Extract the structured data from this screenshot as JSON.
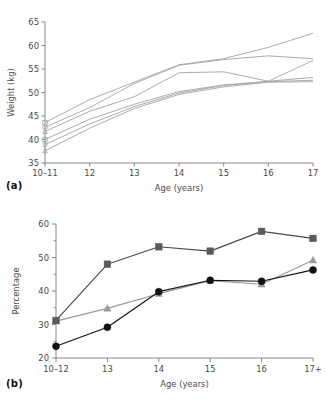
{
  "figure": {
    "panels": [
      {
        "id": "a",
        "label": "(a)",
        "chart_data": {
          "type": "line",
          "title": "",
          "xlabel": "Age (years)",
          "ylabel": "Weight (kg)",
          "categories": [
            "10–11",
            "12",
            "13",
            "14",
            "15",
            "16",
            "17"
          ],
          "xticklabels": [
            "10–11",
            "12",
            "13",
            "14",
            "15",
            "16",
            "17"
          ],
          "yticklabels": [
            "35",
            "40",
            "45",
            "50",
            "55",
            "60",
            "65"
          ],
          "yticks": [
            35,
            40,
            45,
            50,
            55,
            60,
            65
          ],
          "ylim": [
            35,
            65
          ],
          "grid": false,
          "legend": "none",
          "line_color": "#a8a8a8",
          "marker": "open-square-circle-triangle-at-first-point",
          "series": [
            {
              "name": "cohort-1",
              "values": [
                43.6,
                48.5,
                52.2,
                55.9,
                57.2,
                59.6,
                62.6
              ]
            },
            {
              "name": "cohort-2",
              "values": [
                42.6,
                46.8,
                51.9,
                55.8,
                57.0,
                57.8,
                57.2
              ]
            },
            {
              "name": "cohort-3",
              "values": [
                41.7,
                46.0,
                49.1,
                54.2,
                54.4,
                52.4,
                56.8
              ]
            },
            {
              "name": "cohort-4",
              "values": [
                40.0,
                44.3,
                47.5,
                50.2,
                51.6,
                52.4,
                53.2
              ]
            },
            {
              "name": "cohort-5",
              "values": [
                38.9,
                43.3,
                47.0,
                49.9,
                51.5,
                52.3,
                52.6
              ]
            },
            {
              "name": "cohort-6",
              "values": [
                37.6,
                42.4,
                46.6,
                49.6,
                51.2,
                52.2,
                52.3
              ]
            }
          ]
        }
      },
      {
        "id": "b",
        "label": "(b)",
        "chart_data": {
          "type": "line",
          "title": "",
          "xlabel": "Age (years)",
          "ylabel": "Percentage",
          "categories": [
            "10–12",
            "13",
            "14",
            "15",
            "16",
            "17+"
          ],
          "xticklabels": [
            "10–12",
            "13",
            "14",
            "15",
            "16",
            "17+"
          ],
          "yticklabels": [
            "20",
            "30",
            "40",
            "50",
            "60"
          ],
          "yticks": [
            20,
            30,
            40,
            50,
            60
          ],
          "yminorticks": [
            25,
            35,
            45,
            55
          ],
          "ylim": [
            20,
            60
          ],
          "grid": false,
          "legend": "none",
          "series": [
            {
              "name": "series-square",
              "marker": "square",
              "color": "#5a5a5a",
              "line_color": "#4a4a4a",
              "values": [
                31.2,
                48.0,
                53.2,
                51.9,
                57.8,
                55.7
              ]
            },
            {
              "name": "series-triangle",
              "marker": "triangle",
              "color": "#9a9a9a",
              "line_color": "#9a9a9a",
              "values": [
                31.0,
                34.8,
                39.2,
                43.1,
                42.0,
                49.2
              ]
            },
            {
              "name": "series-circle",
              "marker": "circle",
              "color": "#111111",
              "line_color": "#111111",
              "values": [
                23.5,
                29.2,
                39.8,
                43.2,
                42.9,
                46.3
              ]
            }
          ]
        }
      }
    ]
  }
}
